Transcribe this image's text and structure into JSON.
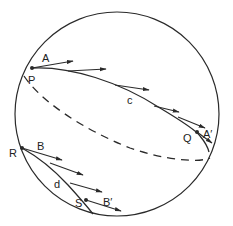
{
  "diagram": {
    "colors": {
      "stroke": "#2a2a2a",
      "background": "#ffffff"
    },
    "sphere": {
      "cx": 117,
      "cy": 114,
      "r": 102
    },
    "labels": {
      "A": "A",
      "P": "P",
      "c": "c",
      "Q": "Q",
      "A_prime": "A′",
      "R": "R",
      "B": "B",
      "d": "d",
      "S": "S",
      "B_prime": "B′"
    },
    "points": {
      "P": {
        "x": 32,
        "y": 68
      },
      "Q": {
        "x": 197,
        "y": 132
      },
      "R": {
        "x": 22,
        "y": 148
      },
      "S": {
        "x": 86,
        "y": 200
      }
    },
    "curves": [
      {
        "name": "c",
        "style": "solid",
        "from": "P",
        "to": "Q"
      },
      {
        "name": "equator-back",
        "style": "dashed"
      },
      {
        "name": "d",
        "style": "solid",
        "from": "R",
        "to": "S"
      }
    ],
    "vectors_along_c": 5,
    "vectors_along_d": 4
  }
}
